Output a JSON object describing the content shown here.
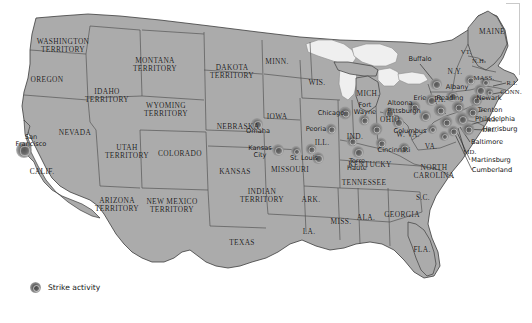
{
  "map": {
    "title": "Strike activity map of the United States",
    "colors": {
      "land": "#ababab",
      "water": "#ffffff",
      "lakes": "#efefef",
      "border": "#4a4a4a",
      "outline": "#3a3a3a",
      "strike": "#5d5d5d",
      "text": "#1b1b1b"
    }
  },
  "legend": {
    "label": "Strike activity",
    "marker": "strike-blob-icon"
  },
  "states": [
    {
      "name": "WASHINGTON\nTERRITORY",
      "x": 63,
      "y": 46,
      "cls": "state"
    },
    {
      "name": "OREGON",
      "x": 47,
      "y": 80,
      "cls": "state"
    },
    {
      "name": "IDAHO\nTERRITORY",
      "x": 107,
      "y": 96,
      "cls": "state"
    },
    {
      "name": "MONTANA\nTERRITORY",
      "x": 155,
      "y": 65,
      "cls": "state"
    },
    {
      "name": "WYOMING\nTERRITORY",
      "x": 166,
      "y": 110,
      "cls": "state"
    },
    {
      "name": "DAKOTA\nTERRITORY",
      "x": 232,
      "y": 72,
      "cls": "state"
    },
    {
      "name": "MINN.",
      "x": 277,
      "y": 62,
      "cls": "state"
    },
    {
      "name": "NEVADA",
      "x": 75,
      "y": 133,
      "cls": "state"
    },
    {
      "name": "UTAH\nTERRITORY",
      "x": 127,
      "y": 152,
      "cls": "state"
    },
    {
      "name": "COLORADO",
      "x": 180,
      "y": 154,
      "cls": "state"
    },
    {
      "name": "NEBRASKA",
      "x": 238,
      "y": 127,
      "cls": "state"
    },
    {
      "name": "IOWA",
      "x": 277,
      "y": 117,
      "cls": "state"
    },
    {
      "name": "WIS.",
      "x": 317,
      "y": 83,
      "cls": "state"
    },
    {
      "name": "MICH.",
      "x": 368,
      "y": 94,
      "cls": "state"
    },
    {
      "name": "CALIF.",
      "x": 42,
      "y": 172,
      "cls": "state"
    },
    {
      "name": "ARIZONA\nTERRITORY",
      "x": 117,
      "y": 205,
      "cls": "state"
    },
    {
      "name": "NEW MEXICO\nTERRITORY",
      "x": 172,
      "y": 206,
      "cls": "state"
    },
    {
      "name": "KANSAS",
      "x": 235,
      "y": 172,
      "cls": "state"
    },
    {
      "name": "INDIAN\nTERRITORY",
      "x": 262,
      "y": 196,
      "cls": "state"
    },
    {
      "name": "MISSOURI",
      "x": 290,
      "y": 170,
      "cls": "state"
    },
    {
      "name": "ILL.",
      "x": 322,
      "y": 143,
      "cls": "state"
    },
    {
      "name": "IND.",
      "x": 355,
      "y": 137,
      "cls": "state"
    },
    {
      "name": "OHIO",
      "x": 390,
      "y": 120,
      "cls": "state"
    },
    {
      "name": "KENTUCKY",
      "x": 370,
      "y": 165,
      "cls": "state"
    },
    {
      "name": "TENNESSEE",
      "x": 364,
      "y": 183,
      "cls": "state"
    },
    {
      "name": "ARK.",
      "x": 311,
      "y": 200,
      "cls": "state"
    },
    {
      "name": "TEXAS",
      "x": 242,
      "y": 243,
      "cls": "state"
    },
    {
      "name": "LA.",
      "x": 309,
      "y": 232,
      "cls": "state"
    },
    {
      "name": "MISS.",
      "x": 341,
      "y": 222,
      "cls": "state"
    },
    {
      "name": "ALA.",
      "x": 366,
      "y": 218,
      "cls": "state"
    },
    {
      "name": "GEORGIA",
      "x": 402,
      "y": 215,
      "cls": "state"
    },
    {
      "name": "FLA.",
      "x": 422,
      "y": 250,
      "cls": "state"
    },
    {
      "name": "S.C.",
      "x": 423,
      "y": 198,
      "cls": "state"
    },
    {
      "name": "NORTH\nCAROLINA",
      "x": 434,
      "y": 172,
      "cls": "state"
    },
    {
      "name": "VA.",
      "x": 431,
      "y": 147,
      "cls": "state"
    },
    {
      "name": "W. VA.",
      "x": 408,
      "y": 135,
      "cls": "state"
    },
    {
      "name": "PA.",
      "x": 440,
      "y": 100,
      "cls": "state"
    },
    {
      "name": "N.Y.",
      "x": 455,
      "y": 72,
      "cls": "state"
    },
    {
      "name": "VT.",
      "x": 466,
      "y": 52,
      "cls": "state sm"
    },
    {
      "name": "N.H.",
      "x": 479,
      "y": 61,
      "cls": "state sm"
    },
    {
      "name": "MAINE",
      "x": 492,
      "y": 32,
      "cls": "state"
    },
    {
      "name": "MASS.",
      "x": 484,
      "y": 78,
      "cls": "state sm"
    },
    {
      "name": "R.I.",
      "x": 512,
      "y": 83,
      "cls": "state sm"
    },
    {
      "name": "CONN.",
      "x": 511,
      "y": 92,
      "cls": "state sm"
    },
    {
      "name": "N.J.",
      "x": 492,
      "y": 120,
      "cls": "state sm"
    },
    {
      "name": "DEL.",
      "x": 490,
      "y": 130,
      "cls": "state sm"
    },
    {
      "name": "MD.",
      "x": 470,
      "y": 152,
      "cls": "state sm"
    }
  ],
  "cities": [
    {
      "name": "San\nFrancisco",
      "x": 31,
      "y": 141,
      "align": "center"
    },
    {
      "name": "Omaha",
      "x": 258,
      "y": 131,
      "align": "center"
    },
    {
      "name": "Kansas\nCity",
      "x": 260,
      "y": 152,
      "align": "center"
    },
    {
      "name": "St. Louis",
      "x": 304,
      "y": 158,
      "align": "center"
    },
    {
      "name": "Peoria",
      "x": 316,
      "y": 129,
      "align": "center"
    },
    {
      "name": "Chicago",
      "x": 331,
      "y": 113,
      "align": "center"
    },
    {
      "name": "Terre\nHaute",
      "x": 357,
      "y": 165,
      "align": "center"
    },
    {
      "name": "Fort\nWayne",
      "x": 365,
      "y": 109,
      "align": "center"
    },
    {
      "name": "Cincinnati",
      "x": 394,
      "y": 150,
      "align": "center"
    },
    {
      "name": "Columbus",
      "x": 410,
      "y": 131,
      "align": "center"
    },
    {
      "name": "Altoona",
      "x": 400,
      "y": 103,
      "align": "center"
    },
    {
      "name": "Pittsburgh",
      "x": 404,
      "y": 111,
      "align": "center"
    },
    {
      "name": "Erie",
      "x": 420,
      "y": 98,
      "align": "center"
    },
    {
      "name": "Buffalo",
      "x": 420,
      "y": 59,
      "align": "center"
    },
    {
      "name": "Albany",
      "x": 457,
      "y": 87,
      "align": "center"
    },
    {
      "name": "Reading",
      "x": 450,
      "y": 98,
      "align": "center"
    },
    {
      "name": "Newark",
      "x": 489,
      "y": 98,
      "align": "center"
    },
    {
      "name": "Trenton",
      "x": 490,
      "y": 110,
      "align": "center"
    },
    {
      "name": "Philadelphia",
      "x": 495,
      "y": 119,
      "align": "center"
    },
    {
      "name": "Harrisburg",
      "x": 500,
      "y": 129,
      "align": "center"
    },
    {
      "name": "Baltimore",
      "x": 487,
      "y": 142,
      "align": "center"
    },
    {
      "name": "Martinsburg",
      "x": 491,
      "y": 160,
      "align": "center"
    },
    {
      "name": "Cumberland",
      "x": 492,
      "y": 170,
      "align": "center"
    }
  ],
  "strike_markers": [
    {
      "x": 24,
      "y": 150,
      "r": 16
    },
    {
      "x": 257,
      "y": 124,
      "r": 12
    },
    {
      "x": 278,
      "y": 150,
      "r": 12
    },
    {
      "x": 296,
      "y": 151,
      "r": 10
    },
    {
      "x": 311,
      "y": 149,
      "r": 11
    },
    {
      "x": 318,
      "y": 158,
      "r": 12
    },
    {
      "x": 331,
      "y": 129,
      "r": 11
    },
    {
      "x": 345,
      "y": 113,
      "r": 13
    },
    {
      "x": 352,
      "y": 141,
      "r": 11
    },
    {
      "x": 358,
      "y": 152,
      "r": 12
    },
    {
      "x": 364,
      "y": 120,
      "r": 11
    },
    {
      "x": 376,
      "y": 129,
      "r": 13
    },
    {
      "x": 381,
      "y": 143,
      "r": 11
    },
    {
      "x": 389,
      "y": 113,
      "r": 12
    },
    {
      "x": 398,
      "y": 122,
      "r": 12
    },
    {
      "x": 404,
      "y": 148,
      "r": 11
    },
    {
      "x": 414,
      "y": 107,
      "r": 13
    },
    {
      "x": 425,
      "y": 116,
      "r": 12
    },
    {
      "x": 431,
      "y": 100,
      "r": 12
    },
    {
      "x": 440,
      "y": 110,
      "r": 13
    },
    {
      "x": 446,
      "y": 122,
      "r": 13
    },
    {
      "x": 436,
      "y": 84,
      "r": 12
    },
    {
      "x": 452,
      "y": 96,
      "r": 12
    },
    {
      "x": 458,
      "y": 107,
      "r": 13
    },
    {
      "x": 462,
      "y": 119,
      "r": 14
    },
    {
      "x": 468,
      "y": 129,
      "r": 13
    },
    {
      "x": 472,
      "y": 112,
      "r": 13
    },
    {
      "x": 476,
      "y": 100,
      "r": 13
    },
    {
      "x": 480,
      "y": 90,
      "r": 12
    },
    {
      "x": 470,
      "y": 80,
      "r": 11
    },
    {
      "x": 485,
      "y": 82,
      "r": 10
    },
    {
      "x": 489,
      "y": 92,
      "r": 9
    },
    {
      "x": 453,
      "y": 131,
      "r": 11
    },
    {
      "x": 444,
      "y": 136,
      "r": 10
    },
    {
      "x": 432,
      "y": 129,
      "r": 10
    }
  ],
  "leader_lines": [
    {
      "x1": 487,
      "y1": 120,
      "x2": 466,
      "y2": 126
    },
    {
      "x1": 485,
      "y1": 130,
      "x2": 463,
      "y2": 129
    },
    {
      "x1": 470,
      "y1": 142,
      "x2": 460,
      "y2": 127
    },
    {
      "x1": 465,
      "y1": 152,
      "x2": 458,
      "y2": 128
    },
    {
      "x1": 470,
      "y1": 160,
      "x2": 455,
      "y2": 128
    },
    {
      "x1": 472,
      "y1": 170,
      "x2": 452,
      "y2": 128
    },
    {
      "x1": 485,
      "y1": 110,
      "x2": 470,
      "y2": 114
    },
    {
      "x1": 487,
      "y1": 98,
      "x2": 475,
      "y2": 100
    },
    {
      "x1": 506,
      "y1": 83,
      "x2": 493,
      "y2": 86
    },
    {
      "x1": 504,
      "y1": 92,
      "x2": 492,
      "y2": 94
    },
    {
      "x1": 420,
      "y1": 64,
      "x2": 433,
      "y2": 80
    }
  ]
}
